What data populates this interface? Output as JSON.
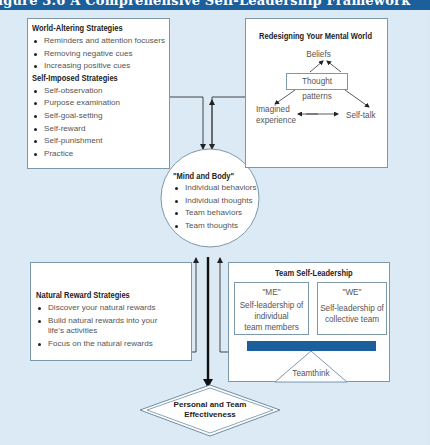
{
  "title": "igure 3.6  A Comprehensive Self-Leadership Framework",
  "colors": {
    "title_bar": "#1b5f9c",
    "background": "#dbeaf4",
    "box_border": "#7d97ab",
    "teamthink_bar": "#1b5f9c"
  },
  "world_altering": {
    "heading": "World-Altering Strategies",
    "items": [
      "Reminders and attention focusers",
      "Removing negative cues",
      "Increasing positive cues"
    ]
  },
  "self_imposed": {
    "heading": "Self-Imposed Strategies",
    "items": [
      "Self-observation",
      "Purpose examination",
      "Self-goal-setting",
      "Self-reward",
      "Self-punishment",
      "Practice"
    ]
  },
  "mental_world": {
    "heading": "Redesigning Your Mental World",
    "beliefs": "Beliefs",
    "thought_patterns": "Thought patterns",
    "imagined_1": "Imagined",
    "imagined_2": "experience",
    "self_talk": "Self-talk"
  },
  "mind_body": {
    "heading": "\"Mind and Body\"",
    "items": [
      "Individual behaviors",
      "Individual thoughts",
      "Team behaviors",
      "Team thoughts"
    ]
  },
  "natural_reward": {
    "heading": "Natural Reward Strategies",
    "items": [
      "Discover your natural rewards",
      "Build natural rewards into your",
      "Focus on the natural rewards"
    ],
    "item2_cont": "life's activities"
  },
  "team_self_leadership": {
    "heading": "Team Self-Leadership",
    "me": {
      "label": "\"ME\"",
      "line1": "Self-leadership of",
      "line2": "individual",
      "line3": "team members"
    },
    "we": {
      "label": "\"WE\"",
      "line1": "Self-leadership of",
      "line2": "collective team"
    },
    "teamthink": "Teamthink"
  },
  "outcome": {
    "line1": "Personal and Team",
    "line2": "Effectiveness"
  }
}
